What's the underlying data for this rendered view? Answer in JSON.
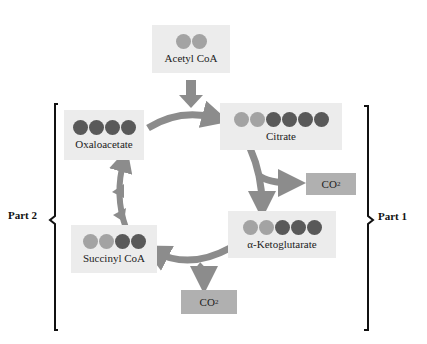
{
  "nodes": {
    "acetyl_coa": {
      "label": "Acetyl CoA",
      "carbons": [
        "light",
        "light"
      ]
    },
    "citrate": {
      "label": "Citrate",
      "carbons": [
        "light",
        "light",
        "dark",
        "dark",
        "dark",
        "dark"
      ]
    },
    "alpha_ketoglutarate": {
      "label": "α-Ketoglutarate",
      "carbons": [
        "light",
        "light",
        "dark",
        "dark",
        "dark"
      ]
    },
    "succinyl_coa": {
      "label": "Succinyl CoA",
      "carbons": [
        "light",
        "light",
        "dark",
        "dark"
      ]
    },
    "oxaloacetate": {
      "label": "Oxaloacetate",
      "carbons": [
        "dark",
        "dark",
        "dark",
        "dark"
      ]
    }
  },
  "co2_outputs": [
    {
      "text": "CO",
      "sub": "2"
    },
    {
      "text": "CO",
      "sub": "2"
    }
  ],
  "brackets": {
    "left": "Part 2",
    "right": "Part 1"
  },
  "colors": {
    "box_bg": "#ececec",
    "co2_bg": "#b0b0b0",
    "arrow": "#8c8c8c",
    "light_carbon": "#a3a3a3",
    "dark_carbon": "#595959"
  }
}
